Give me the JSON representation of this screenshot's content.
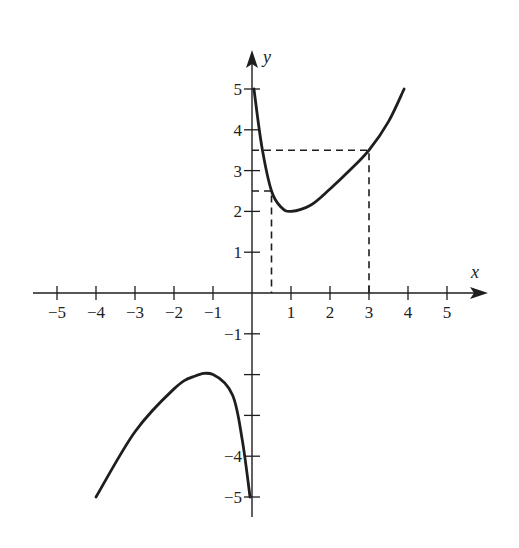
{
  "chart_data": {
    "type": "line",
    "title": "",
    "xlabel": "x",
    "ylabel": "y",
    "xlim": [
      -5.5,
      6
    ],
    "ylim": [
      -5.6,
      6
    ],
    "grid": false,
    "x_ticks": [
      -5,
      -4,
      -3,
      -2,
      -1,
      1,
      2,
      3,
      4,
      5
    ],
    "x_tick_labels": [
      "−5",
      "−4",
      "−3",
      "−2",
      "−1",
      "1",
      "2",
      "3",
      "4",
      "5"
    ],
    "y_ticks": [
      5,
      4,
      3,
      2,
      1,
      -1,
      -2,
      -3,
      -4,
      -5
    ],
    "y_tick_labels": [
      "5",
      "4",
      "3",
      "2",
      "1",
      "−1",
      "",
      "",
      "−4",
      "−5"
    ],
    "series": [
      {
        "name": "right branch",
        "style": "solid",
        "points": [
          [
            0.05,
            5
          ],
          [
            0.25,
            3.6
          ],
          [
            0.5,
            2.5
          ],
          [
            0.75,
            2.1
          ],
          [
            1,
            2
          ],
          [
            1.5,
            2.15
          ],
          [
            2,
            2.55
          ],
          [
            2.5,
            3.0
          ],
          [
            3,
            3.5
          ],
          [
            3.5,
            4.2
          ],
          [
            3.9,
            5
          ]
        ]
      },
      {
        "name": "left branch",
        "style": "solid",
        "points": [
          [
            -4,
            -5
          ],
          [
            -3,
            -3.4
          ],
          [
            -2,
            -2.35
          ],
          [
            -1.5,
            -2.05
          ],
          [
            -1,
            -2
          ],
          [
            -0.5,
            -2.5
          ],
          [
            -0.25,
            -3.6
          ],
          [
            -0.05,
            -5
          ]
        ]
      }
    ],
    "annotations": [
      {
        "type": "dashed-guide",
        "from": [
          0,
          2.5
        ],
        "corner": [
          0.5,
          2.5
        ],
        "to": [
          0.5,
          0
        ]
      },
      {
        "type": "dashed-guide",
        "from": [
          0,
          3.5
        ],
        "corner": [
          3,
          3.5
        ],
        "to": [
          3,
          0
        ]
      }
    ]
  },
  "labels": {
    "x_axis": "x",
    "y_axis": "y"
  }
}
